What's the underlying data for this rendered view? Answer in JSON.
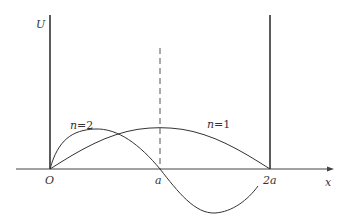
{
  "diagram": {
    "title": "",
    "axes": {
      "y_label": "U",
      "x_label": "x",
      "origin_label": "O",
      "tick_a": "a",
      "tick_2a": "2a"
    },
    "curves": [
      {
        "label_n": "n",
        "label_eq": "=",
        "label_val": "1",
        "description": "half sine wave from O to 2a"
      },
      {
        "label_n": "n",
        "label_eq": "=",
        "label_val": "2",
        "description": "full sine wave from O to 2a, positive lobe then negative lobe"
      }
    ],
    "walls": [
      "left infinite wall at O",
      "right infinite wall at 2a"
    ],
    "midline": "dashed vertical line at x = a",
    "colors": {
      "line": "#333333",
      "background": "#ffffff"
    }
  }
}
